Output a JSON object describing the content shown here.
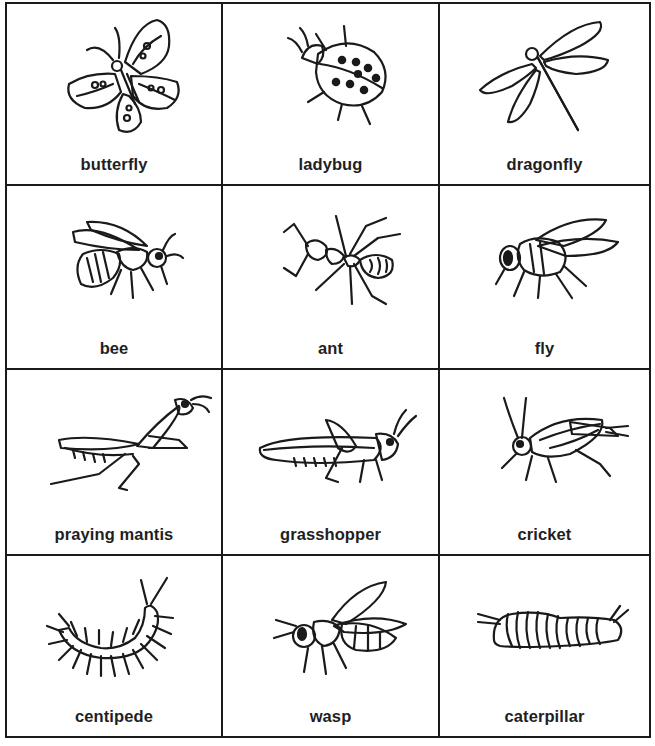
{
  "worksheet": {
    "cards": [
      {
        "label": "butterfly",
        "icon": "butterfly-icon"
      },
      {
        "label": "ladybug",
        "icon": "ladybug-icon"
      },
      {
        "label": "dragonfly",
        "icon": "dragonfly-icon"
      },
      {
        "label": "bee",
        "icon": "bee-icon"
      },
      {
        "label": "ant",
        "icon": "ant-icon"
      },
      {
        "label": "fly",
        "icon": "fly-icon"
      },
      {
        "label": "praying mantis",
        "icon": "praying-mantis-icon"
      },
      {
        "label": "grasshopper",
        "icon": "grasshopper-icon"
      },
      {
        "label": "cricket",
        "icon": "cricket-icon"
      },
      {
        "label": "centipede",
        "icon": "centipede-icon"
      },
      {
        "label": "wasp",
        "icon": "wasp-icon"
      },
      {
        "label": "caterpillar",
        "icon": "caterpillar-icon"
      }
    ]
  },
  "colors": {
    "ink": "#1a1a1a",
    "paper": "#ffffff"
  }
}
